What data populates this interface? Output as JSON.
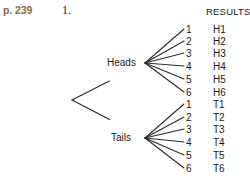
{
  "page_reference": "p. 239",
  "problem_number": "1.",
  "columns": {
    "results_header": "RESULTS"
  },
  "colors": {
    "page_reference": "#8a6849",
    "text": "#1a1a1a",
    "branch": "#2b2b2b",
    "background": "#ffffff"
  },
  "tree": {
    "root": {
      "x": 72,
      "y": 100
    },
    "branches": [
      {
        "label": "Heads",
        "fan_origin": {
          "x": 145,
          "y": 63
        },
        "outcomes": [
          {
            "number": "1",
            "result": "H1",
            "y": 24
          },
          {
            "number": "2",
            "result": "H2",
            "y": 36
          },
          {
            "number": "3",
            "result": "H3",
            "y": 48
          },
          {
            "number": "4",
            "result": "H4",
            "y": 61
          },
          {
            "number": "5",
            "result": "H5",
            "y": 74
          },
          {
            "number": "6",
            "result": "H6",
            "y": 87
          }
        ]
      },
      {
        "label": "Tails",
        "fan_origin": {
          "x": 145,
          "y": 138
        },
        "outcomes": [
          {
            "number": "1",
            "result": "T1",
            "y": 99
          },
          {
            "number": "2",
            "result": "T2",
            "y": 112
          },
          {
            "number": "3",
            "result": "T3",
            "y": 124
          },
          {
            "number": "4",
            "result": "T4",
            "y": 137
          },
          {
            "number": "5",
            "result": "T5",
            "y": 150
          },
          {
            "number": "6",
            "result": "T6",
            "y": 163
          }
        ]
      }
    ]
  }
}
